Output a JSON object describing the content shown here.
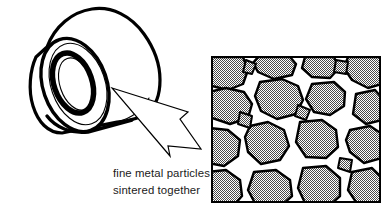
{
  "figure": {
    "background_color": "#ffffff",
    "line_color": "#000000"
  },
  "part": {
    "name": "cylindrical bushing",
    "description": "hollow cylinder shown in three-quarter view with visible bore",
    "outline_color": "#000000",
    "body_fill": "#ffffff"
  },
  "callout": {
    "name": "magnification arrow",
    "label": "",
    "style": "hollow outline arrow",
    "from_x": 112,
    "from_y": 88,
    "to_x": 201,
    "to_y": 149,
    "stroke_color": "#000000",
    "fill_color": "#ffffff"
  },
  "caption": {
    "line1": "fine metal particles",
    "line2": "sintered together",
    "x": 113,
    "line1_y": 177,
    "line2_y": 194,
    "color": "#1a1a1a"
  },
  "micrograph": {
    "name": "microstructure detail box",
    "x": 211,
    "y": 56,
    "width": 170,
    "height": 147,
    "border_color": "#000000",
    "border_width": 2,
    "particle_fill": "#9e9e9e",
    "pore_fill": "#ffffff",
    "boundary_color": "#000000",
    "pattern": "stipple",
    "particle_count": 26,
    "legend_note": "gray stippled regions are metal particles; white regions are pores between them"
  }
}
